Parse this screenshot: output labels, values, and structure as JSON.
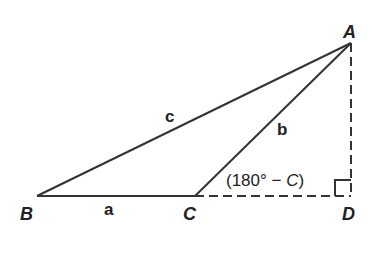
{
  "diagram": {
    "type": "triangle with external altitude",
    "points": {
      "A": {
        "label": "A",
        "x": 351,
        "y": 43
      },
      "B": {
        "label": "B",
        "x": 37,
        "y": 196
      },
      "C": {
        "label": "C",
        "x": 195,
        "y": 196
      },
      "D": {
        "label": "D",
        "x": 351,
        "y": 196
      }
    },
    "sides": {
      "a": {
        "label": "a",
        "from": "B",
        "to": "C"
      },
      "b": {
        "label": "b",
        "from": "C",
        "to": "A"
      },
      "c": {
        "label": "c",
        "from": "B",
        "to": "A"
      }
    },
    "dashed_segments": [
      {
        "from": "C",
        "to": "D"
      },
      {
        "from": "A",
        "to": "D"
      }
    ],
    "angle_label": {
      "text_prefix": "(180° − ",
      "var": "C",
      "text_suffix": ")"
    },
    "right_angle_at": "D",
    "colors": {
      "line": "#333333",
      "background": "#ffffff"
    }
  }
}
